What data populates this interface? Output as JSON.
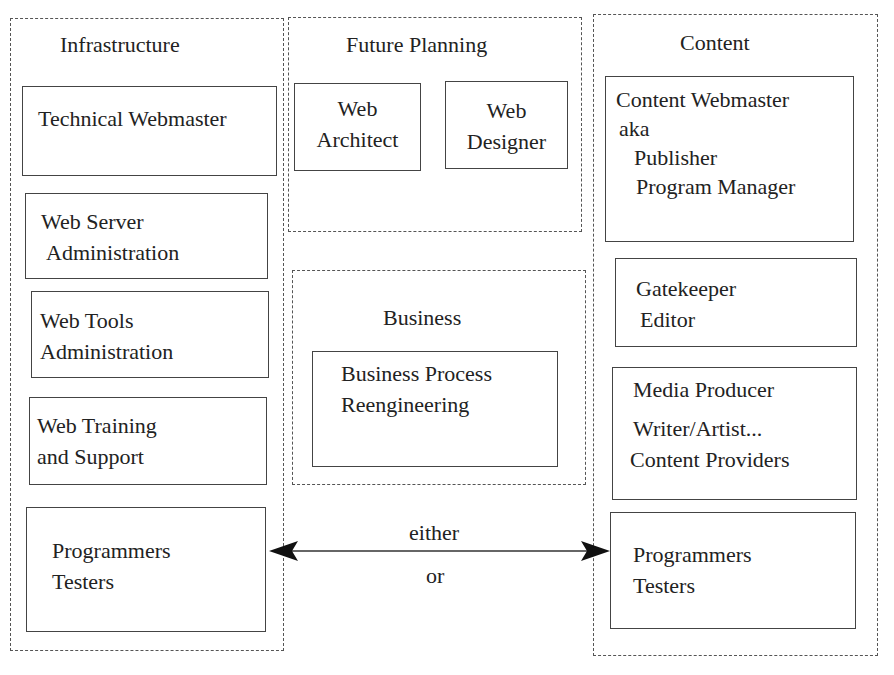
{
  "diagram": {
    "groups": {
      "infrastructure": {
        "title": "Infrastructure",
        "roles": [
          {
            "lines": [
              "Technical Webmaster"
            ]
          },
          {
            "lines": [
              "Web Server",
              "Administration"
            ]
          },
          {
            "lines": [
              "Web Tools",
              "Administration"
            ]
          },
          {
            "lines": [
              "Web Training",
              "and Support"
            ]
          },
          {
            "lines": [
              "Programmers",
              "Testers"
            ]
          }
        ]
      },
      "future_planning": {
        "title": "Future Planning",
        "roles": [
          {
            "lines": [
              "Web",
              "Architect"
            ]
          },
          {
            "lines": [
              "Web",
              "Designer"
            ]
          }
        ]
      },
      "business": {
        "title": "Business",
        "roles": [
          {
            "lines": [
              "Business Process",
              "Reengineering"
            ]
          }
        ]
      },
      "content": {
        "title": "Content",
        "roles": [
          {
            "lines": [
              "Content Webmaster",
              "aka",
              "Publisher",
              "Program Manager"
            ]
          },
          {
            "lines": [
              "Gatekeeper",
              "Editor"
            ]
          },
          {
            "lines": [
              "Media Producer",
              "Writer/Artist...",
              "Content Providers"
            ]
          },
          {
            "lines": [
              "Programmers",
              "Testers"
            ]
          }
        ]
      }
    },
    "connector": {
      "label_top": "either",
      "label_bottom": "or",
      "type": "bidirectional-arrow",
      "from": "infrastructure.programmers-testers",
      "to": "content.programmers-testers"
    },
    "colors": {
      "line": "#444444",
      "dashed": "#555555",
      "text": "#222222",
      "background": "#ffffff"
    }
  }
}
